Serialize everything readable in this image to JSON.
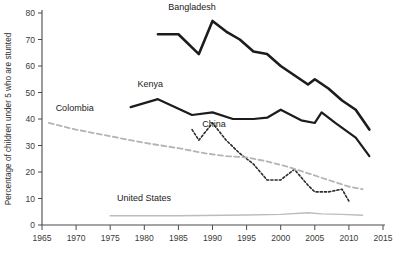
{
  "chart_data": {
    "type": "line",
    "title": "",
    "subtitle": "",
    "xlabel": "",
    "ylabel": "Percentage of children under 5 who are stunted",
    "xlim": [
      1965,
      2015
    ],
    "ylim": [
      0,
      80
    ],
    "grid": false,
    "legend_position": "inline-labels",
    "x_ticks": [
      "1965",
      "1970",
      "1975",
      "1980",
      "1985",
      "1990",
      "1995",
      "2000",
      "2005",
      "2010",
      "2015"
    ],
    "x_tick_values": [
      1965,
      1970,
      1975,
      1980,
      1985,
      1990,
      1995,
      2000,
      2005,
      2010,
      2015
    ],
    "y_ticks": [
      "0",
      "10",
      "20",
      "30",
      "40",
      "50",
      "60",
      "70",
      "80"
    ],
    "y_tick_values": [
      0,
      10,
      20,
      30,
      40,
      50,
      60,
      70,
      80
    ],
    "series": [
      {
        "name": "Bangladesh",
        "label": "Bangladesh",
        "color": "#1c1c1c",
        "style": "solid",
        "width": 2.6,
        "label_x": 1983.5,
        "label_y": 81,
        "x": [
          1982,
          1985,
          1988,
          1990,
          1992,
          1994,
          1996,
          1998,
          2000,
          2002,
          2004,
          2005,
          2007,
          2009,
          2011,
          2013
        ],
        "y": [
          72,
          72,
          64.5,
          77,
          73,
          70,
          65.5,
          64.5,
          60,
          56.5,
          53,
          55,
          51.5,
          47,
          43.5,
          36
        ]
      },
      {
        "name": "Kenya",
        "label": "Kenya",
        "color": "#1c1c1c",
        "style": "solid",
        "width": 2.2,
        "label_x": 1979,
        "label_y": 52,
        "x": [
          1978,
          1982,
          1987,
          1990,
          1993,
          1996,
          1998,
          2000,
          2003,
          2005,
          2006,
          2008,
          2011,
          2013
        ],
        "y": [
          44.5,
          47.5,
          41.5,
          42.5,
          40,
          40,
          40.5,
          43.5,
          39.5,
          38.5,
          42.5,
          38.5,
          33,
          26
        ]
      },
      {
        "name": "China",
        "label": "China",
        "color": "#2b2b2b",
        "style": "dotted",
        "width": 1.6,
        "label_x": 1988.5,
        "label_y": 37,
        "x": [
          1987,
          1988,
          1990,
          1992,
          1994,
          1996,
          1998,
          2000,
          2002,
          2004,
          2005,
          2007,
          2009,
          2010
        ],
        "y": [
          36,
          32,
          38.5,
          32,
          27,
          23,
          17,
          17,
          21,
          15,
          12.5,
          12.5,
          13.5,
          9
        ]
      },
      {
        "name": "Colombia",
        "label": "Colombia",
        "color": "#b4b4b4",
        "style": "dashed",
        "width": 1.8,
        "label_x": 1967,
        "label_y": 43,
        "x": [
          1966,
          1970,
          1975,
          1980,
          1985,
          1989,
          1992,
          1995,
          1998,
          2001,
          2004,
          2007,
          2010,
          2012
        ],
        "y": [
          38.5,
          36,
          33.5,
          31,
          29,
          27,
          26,
          25.5,
          24,
          22,
          19.5,
          17,
          14.5,
          13.5
        ]
      },
      {
        "name": "United States",
        "label": "United States",
        "color": "#bcbcbc",
        "style": "solid",
        "width": 1.4,
        "label_x": 1976,
        "label_y": 9,
        "x": [
          1975,
          1985,
          1995,
          2000,
          2004,
          2006,
          2009,
          2012
        ],
        "y": [
          3.5,
          3.5,
          3.8,
          4.0,
          4.6,
          4.2,
          4.0,
          3.7
        ]
      }
    ]
  }
}
